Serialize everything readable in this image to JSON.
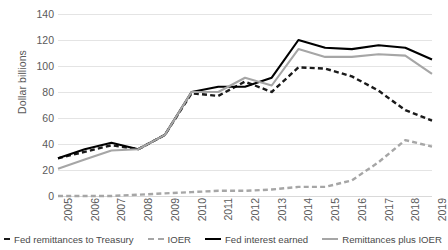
{
  "chart_data": {
    "type": "line",
    "title": "",
    "xlabel": "",
    "ylabel": "Dollar billions",
    "ylim": [
      0,
      140
    ],
    "ytick_step": 20,
    "yticks": [
      140,
      120,
      100,
      80,
      60,
      40,
      20,
      0
    ],
    "grid": true,
    "legend_position": "bottom",
    "categories": [
      "2005",
      "2006",
      "2007",
      "2008",
      "2009",
      "2010",
      "2011",
      "2012",
      "2013",
      "2014",
      "2015",
      "2016",
      "2017",
      "2018",
      "2019"
    ],
    "series": [
      {
        "name": "Fed remittances to Treasury",
        "style": "dashed",
        "color": "#1a1a1a",
        "values": [
          29,
          34,
          39,
          36,
          47,
          79,
          77,
          88,
          80,
          99,
          98,
          92,
          81,
          66,
          58
        ]
      },
      {
        "name": "IOER",
        "style": "dashed",
        "color": "#a6a6a6",
        "values": [
          0,
          0,
          0,
          1,
          2,
          3,
          4,
          4,
          5,
          7,
          7,
          12,
          26,
          43,
          38
        ]
      },
      {
        "name": "Fed interest earned",
        "style": "solid",
        "color": "#000000",
        "values": [
          29,
          36,
          41,
          36,
          47,
          80,
          84,
          84,
          91,
          120,
          114,
          113,
          116,
          114,
          105
        ]
      },
      {
        "name": "Remittances plus IOER",
        "style": "solid",
        "color": "#a6a6a6",
        "values": [
          21,
          28,
          35,
          36,
          47,
          80,
          80,
          91,
          85,
          113,
          107,
          107,
          109,
          108,
          94
        ]
      }
    ]
  },
  "legend": {
    "items": [
      {
        "label": "Fed remittances to Treasury"
      },
      {
        "label": "IOER"
      },
      {
        "label": "Fed interest earned"
      },
      {
        "label": "Remittances plus IOER"
      }
    ]
  }
}
